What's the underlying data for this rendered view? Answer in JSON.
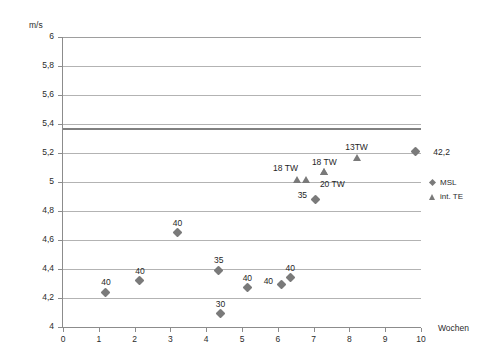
{
  "chart_data": {
    "type": "scatter",
    "title": "",
    "xlabel": "Wochen",
    "ylabel": "m/s",
    "xlim": [
      0,
      10
    ],
    "ylim": [
      4,
      6
    ],
    "grid": true,
    "legend_position": "right",
    "x_ticks": [
      "0",
      "1",
      "2",
      "3",
      "4",
      "5",
      "6",
      "7",
      "8",
      "9",
      "10"
    ],
    "x_tick_values": [
      0,
      1,
      2,
      3,
      4,
      5,
      6,
      7,
      8,
      9,
      10
    ],
    "y_ticks": [
      "4",
      "4,2",
      "4,4",
      "4,6",
      "4,8",
      "5",
      "5,2",
      "5,4",
      "5,6",
      "5,8",
      "6"
    ],
    "y_tick_values": [
      4,
      4.2,
      4.4,
      4.6,
      4.8,
      5,
      5.2,
      5.4,
      5.6,
      5.8,
      6
    ],
    "reference_line": {
      "value": 5.37,
      "label": ""
    },
    "series": [
      {
        "name": "MSL",
        "marker": "diamond",
        "color": "#7a7a7a",
        "points": [
          {
            "x": 1.2,
            "y": 4.24,
            "label": "40",
            "label_pos": "above"
          },
          {
            "x": 2.15,
            "y": 4.32,
            "label": "40",
            "label_pos": "above"
          },
          {
            "x": 3.2,
            "y": 4.65,
            "label": "40",
            "label_pos": "above"
          },
          {
            "x": 4.35,
            "y": 4.39,
            "label": "35",
            "label_pos": "above"
          },
          {
            "x": 4.4,
            "y": 4.09,
            "label": "30",
            "label_pos": "above"
          },
          {
            "x": 5.15,
            "y": 4.27,
            "label": "40",
            "label_pos": "above"
          },
          {
            "x": 6.1,
            "y": 4.29,
            "label": "40",
            "label_pos": "left"
          },
          {
            "x": 6.35,
            "y": 4.34,
            "label": "40",
            "label_pos": "above"
          },
          {
            "x": 7.05,
            "y": 4.88,
            "label": "35",
            "label_pos": "left"
          },
          {
            "x": 9.85,
            "y": 5.21,
            "label": "42,2",
            "label_pos": "right"
          }
        ]
      },
      {
        "name": "int. TE",
        "marker": "triangle",
        "color": "#7a7a7a",
        "points": [
          {
            "x": 6.55,
            "y": 5.02,
            "label": "18 TW",
            "label_pos": "left-above"
          },
          {
            "x": 6.78,
            "y": 5.02,
            "label": "",
            "label_pos": "above"
          },
          {
            "x": 7.3,
            "y": 5.07,
            "label": "18 TW",
            "label_pos": "above"
          },
          {
            "x": 7.3,
            "y": 5.07,
            "label": "20 TW",
            "label_pos": "below-right"
          },
          {
            "x": 8.2,
            "y": 5.17,
            "label": "13TW",
            "label_pos": "above"
          }
        ]
      }
    ]
  },
  "legend": {
    "items": [
      {
        "label": "MSL",
        "marker": "diamond"
      },
      {
        "label": "int. TE",
        "marker": "triangle"
      }
    ]
  }
}
